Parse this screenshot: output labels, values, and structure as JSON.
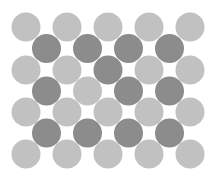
{
  "pattern": {
    "description": "Hexagonal arrangement of grey circles in two shades",
    "colors": {
      "light": "#c1c1c1",
      "dark": "#8c8c8c",
      "background": "#ffffff"
    },
    "rows": [
      [
        "light",
        "light",
        "light",
        "light",
        "light"
      ],
      [
        "dark",
        "dark",
        "dark",
        "dark"
      ],
      [
        "light",
        "light",
        "dark",
        "light",
        "light"
      ],
      [
        "dark",
        "light",
        "dark",
        "dark"
      ],
      [
        "light",
        "light",
        "light",
        "light",
        "light"
      ],
      [
        "dark",
        "dark",
        "dark",
        "dark"
      ],
      [
        "light",
        "light",
        "light",
        "light",
        "light"
      ]
    ]
  }
}
